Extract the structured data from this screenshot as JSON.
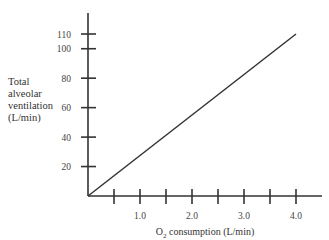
{
  "chart_data": {
    "type": "line",
    "title": "",
    "xlabel": "O2 consumption (L/min)",
    "xlabel_main": "O",
    "xlabel_sub": "2",
    "xlabel_rest": " consumption (L/min)",
    "ylabel": "Total alveolar ventilation (L/min)",
    "ylabel_lines": [
      "Total",
      "alveolar",
      "ventilation",
      "(L/min)"
    ],
    "xlim": [
      0,
      5.0
    ],
    "ylim": [
      0,
      125
    ],
    "x_ticks": [
      0.5,
      1.0,
      1.5,
      2.0,
      2.5,
      3.0,
      3.5,
      4.0
    ],
    "x_tick_labels": {
      "1.0": "1.0",
      "2.0": "2.0",
      "3.0": "3.0",
      "4.0": "4.0"
    },
    "y_ticks": [
      20,
      40,
      60,
      80,
      100,
      110
    ],
    "y_tick_labels": [
      "20",
      "40",
      "60",
      "80",
      "100",
      "110"
    ],
    "grid": false,
    "legend": null,
    "series": [
      {
        "name": "Alveolar ventilation",
        "x": [
          0,
          4.0
        ],
        "y": [
          0,
          110
        ],
        "color": "#333333"
      }
    ]
  }
}
